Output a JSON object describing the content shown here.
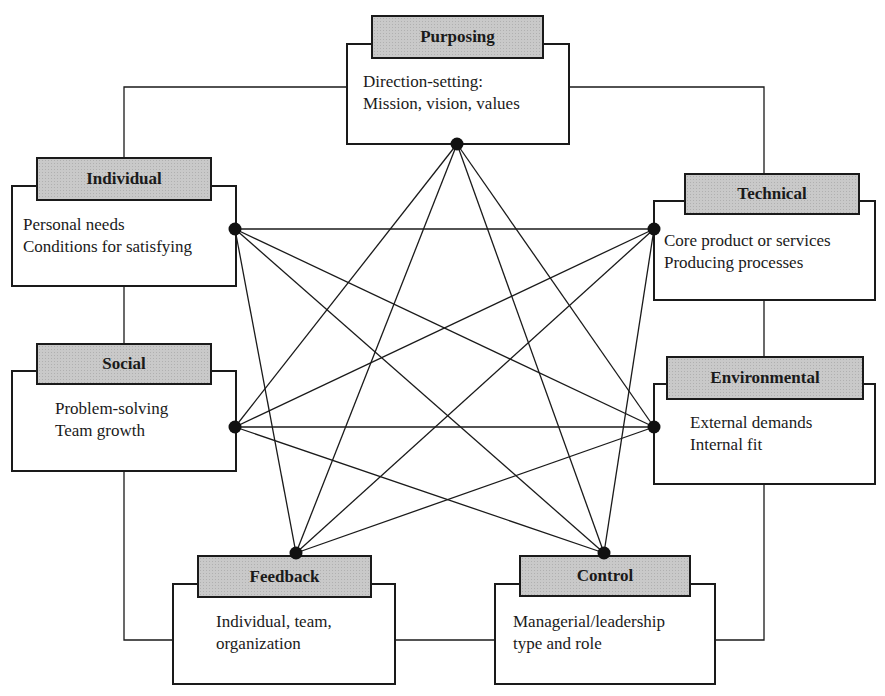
{
  "diagram": {
    "type": "organizational-systems-network",
    "colors": {
      "line": "#1a1a1a",
      "tab_fill": "#c9c9c9",
      "box_fill": "#ffffff",
      "node": "#111111"
    },
    "nodes": [
      {
        "id": "purposing",
        "title": "Purposing",
        "lines": [
          "Direction-setting:",
          "Mission, vision, values"
        ]
      },
      {
        "id": "individual",
        "title": "Individual",
        "lines": [
          "Personal needs",
          "Conditions for satisfying"
        ]
      },
      {
        "id": "technical",
        "title": "Technical",
        "lines": [
          "Core product or services",
          "Producing processes"
        ]
      },
      {
        "id": "social",
        "title": "Social",
        "lines": [
          "Problem-solving",
          "Team growth"
        ]
      },
      {
        "id": "environmental",
        "title": "Environmental",
        "lines": [
          "External demands",
          "Internal fit"
        ]
      },
      {
        "id": "feedback",
        "title": "Feedback",
        "lines": [
          "Individual, team,",
          "organization"
        ]
      },
      {
        "id": "control",
        "title": "Control",
        "lines": [
          "Managerial/leadership",
          "type and role"
        ]
      }
    ],
    "outer_ring": [
      "purposing",
      "individual",
      "social",
      "feedback",
      "control",
      "environmental",
      "technical"
    ],
    "star_edges": [
      [
        "purposing",
        "social"
      ],
      [
        "purposing",
        "feedback"
      ],
      [
        "purposing",
        "control"
      ],
      [
        "purposing",
        "environmental"
      ],
      [
        "individual",
        "technical"
      ],
      [
        "individual",
        "environmental"
      ],
      [
        "individual",
        "control"
      ],
      [
        "individual",
        "feedback"
      ],
      [
        "social",
        "technical"
      ],
      [
        "social",
        "environmental"
      ],
      [
        "social",
        "control"
      ],
      [
        "feedback",
        "technical"
      ],
      [
        "feedback",
        "environmental"
      ],
      [
        "control",
        "technical"
      ]
    ]
  }
}
